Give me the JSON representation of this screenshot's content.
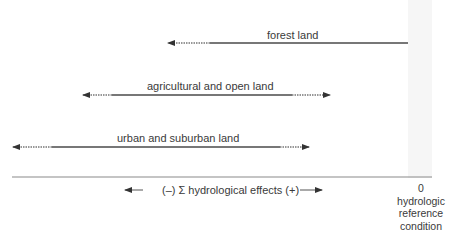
{
  "rows": [
    {
      "label": "forest land",
      "y": 43,
      "dashed_left": [
        170,
        210
      ],
      "solid": [
        210,
        408
      ],
      "dashed_right": null,
      "arrow_left": true,
      "arrow_right": false
    },
    {
      "label": "agricultural and open land",
      "y": 95,
      "dashed_left": [
        85,
        112
      ],
      "solid": [
        112,
        292
      ],
      "dashed_right": [
        292,
        325
      ],
      "arrow_left": true,
      "arrow_right": true
    },
    {
      "label": "urban and suburban land",
      "y": 147,
      "dashed_left": [
        15,
        52
      ],
      "solid": [
        52,
        280
      ],
      "dashed_right": [
        280,
        303
      ],
      "arrow_left": true,
      "arrow_right": true
    }
  ],
  "axis": {
    "caption": "(–) Σ hydrological effects (+)",
    "left_arrow": "←",
    "right_arrow": "→"
  },
  "reference": {
    "value": "0",
    "line1": "hydrologic",
    "line2": "reference",
    "line3": "condition"
  },
  "colors": {
    "line": "#4a4a4a",
    "dotted": "#777777",
    "band": "#f6f6f6"
  }
}
